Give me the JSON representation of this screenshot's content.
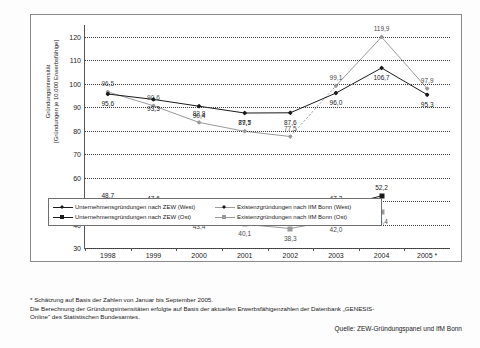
{
  "chart_data": {
    "type": "line",
    "title": "",
    "xlabel": "",
    "ylabel": "Gründungsintensität [Gründungen je 10.000 Erwerbsfähige]",
    "ylim": [
      30,
      125
    ],
    "yticks": [
      30,
      40,
      50,
      60,
      70,
      80,
      90,
      100,
      110,
      120
    ],
    "grid": true,
    "legend_position": "bottom",
    "categories": [
      "1998",
      "1999",
      "2000",
      "2001",
      "2002",
      "2003",
      "2004",
      "2005 *"
    ],
    "series": [
      {
        "name": "Existenzgründungen nach IfM Bonn (West)",
        "marker": "diamond",
        "color": "#9a9a9a",
        "values": [
          96.5,
          90.6,
          83.5,
          79.7,
          77.5,
          99.1,
          119.9,
          97.9
        ],
        "labels": [
          "96,5",
          "90,6",
          "82,8",
          "79,7",
          "77,5",
          "99,1",
          "119,9",
          "97,9"
        ]
      },
      {
        "name": "Unternehmensgründungen nach ZEW (West)",
        "marker": "diamond",
        "color": "#1a1a1a",
        "values": [
          95.6,
          93.3,
          90.4,
          87.5,
          87.6,
          96.0,
          106.7,
          95.3
        ],
        "labels": [
          "95,6",
          "93,3",
          "90,4",
          "87,5",
          "87,6",
          "96,0",
          "106,7",
          "95,3"
        ]
      },
      {
        "name": "Unternehmensgründungen nach ZEW (Ost)",
        "marker": "square",
        "color": "#1a1a1a",
        "values": [
          48.7,
          47.6,
          45.9,
          42.7,
          42.4,
          47.3,
          52.2,
          null
        ],
        "labels": [
          "48,7",
          "47,6",
          "45,9",
          "42,7",
          "42,4",
          "47,3",
          "52,2",
          ""
        ]
      },
      {
        "name": "Existenzgründungen nach IfM Bonn (Ost)",
        "marker": "square",
        "color": "#9a9a9a",
        "values": [
          48.5,
          46.0,
          43.4,
          40.1,
          38.3,
          42.0,
          45.4,
          null
        ],
        "labels": [
          "48,5",
          "46,0",
          "43,4",
          "40,1",
          "38,3",
          "42,0",
          "45,4",
          ""
        ]
      }
    ]
  },
  "legend": {
    "items": [
      {
        "label": "Unternehmensgründungen nach ZEW (West)",
        "marker": "diamond-icon",
        "color": "#1a1a1a"
      },
      {
        "label": "Existenzgründungen nach IfM Bonn (West)",
        "marker": "diamond-icon",
        "color": "#9a9a9a"
      },
      {
        "label": "Unternehmensgründungen nach ZEW (Ost)",
        "marker": "square-icon",
        "color": "#1a1a1a"
      },
      {
        "label": "Existenzgründungen nach IfM Bonn (Ost)",
        "marker": "square-icon",
        "color": "#9a9a9a"
      }
    ]
  },
  "footnotes": {
    "line1": "* Schätzung auf Basis der Zahlen von Januar bis September 2005.",
    "line2": "Die Berechnung der Gründungsintensitäten erfolgte auf Basis der aktuellen Erwerbsfähigenzahlen der Datenbank „GENESIS-",
    "line3": "Online\" des Statistischen Bundesamtes.",
    "source": "Quelle: ZEW-Gründungspanel und IfM Bonn"
  }
}
